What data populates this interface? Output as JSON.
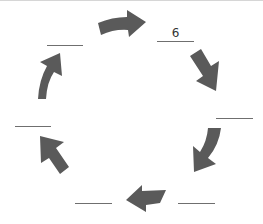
{
  "diagram": {
    "type": "cycle",
    "direction": "clockwise",
    "arrow_color": "#5a5a5a",
    "blanks": [
      {
        "position": "top-right",
        "value": "6"
      },
      {
        "position": "right",
        "value": ""
      },
      {
        "position": "bottom-right",
        "value": ""
      },
      {
        "position": "bottom-left",
        "value": ""
      },
      {
        "position": "left",
        "value": ""
      },
      {
        "position": "top-left",
        "value": ""
      }
    ],
    "arrows": [
      {
        "from": "top-left",
        "to": "top-right",
        "icon": "arrow-right-icon"
      },
      {
        "from": "top-right",
        "to": "right",
        "icon": "arrow-down-right-icon"
      },
      {
        "from": "right",
        "to": "bottom-right",
        "icon": "arrow-down-left-icon"
      },
      {
        "from": "bottom-right",
        "to": "bottom-left",
        "icon": "arrow-left-icon"
      },
      {
        "from": "bottom-left",
        "to": "left",
        "icon": "arrow-up-left-icon"
      },
      {
        "from": "left",
        "to": "top-left",
        "icon": "arrow-up-icon"
      }
    ]
  }
}
